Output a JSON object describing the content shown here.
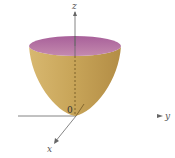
{
  "figure": {
    "type": "3d-surface-plot",
    "surface": "elliptic paraboloid opening upward, vertex at origin",
    "axes": {
      "x_label": "x",
      "y_label": "y",
      "z_label": "z",
      "origin_label": "0"
    },
    "colors": {
      "surface_outer": "#c9a65a",
      "surface_shade": "#b38d45",
      "rim_interior": "#b46f9c",
      "axis": "#666666",
      "y_axis_highlight_1": "#d06a8a",
      "y_axis_highlight_2": "#6ed0c0"
    }
  }
}
